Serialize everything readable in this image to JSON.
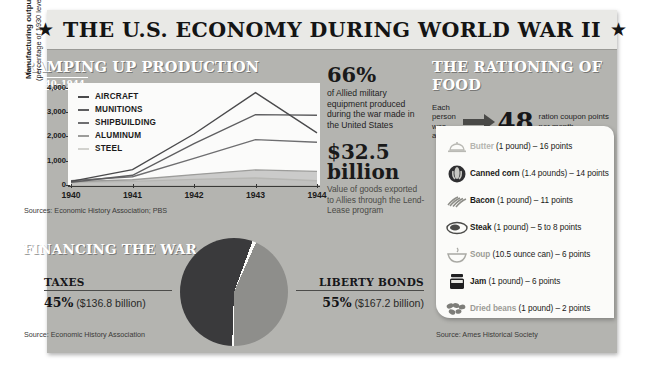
{
  "poster": {
    "title": "THE U.S. ECONOMY DURING WORLD WAR II",
    "star_left": "★",
    "star_right": "★"
  },
  "production": {
    "heading": "RAMPING UP PRODUCTION",
    "date_range": "1940–1944",
    "y_axis_title": "Manufacturing output",
    "y_axis_subtitle": "(percentage of 1930 level)",
    "source": "Sources: Economic History Association; PBS"
  },
  "stats": {
    "percent": "66%",
    "percent_desc": "of Allied military equipment produced during the war made in the United States",
    "dollars": "$32.5 billion",
    "dollars_desc": "Value of goods exported to Allies through the Lend-Lease program"
  },
  "rationing": {
    "heading": "THE RATIONING OF FOOD",
    "allowance_lead": "Each person was allowed",
    "allowance_number": "48",
    "allowance_trail": "ration coupon points per month",
    "source": "Source: Ames Historical Society",
    "items": [
      {
        "icon": "butter-dish-icon",
        "name": "Butter",
        "detail": "(1 pound) – 16 points"
      },
      {
        "icon": "canned-corn-icon",
        "name": "Canned corn",
        "detail": "(1.4 pounds) – 14 points"
      },
      {
        "icon": "bacon-icon",
        "name": "Bacon",
        "detail": "(1 pound) – 11 points"
      },
      {
        "icon": "steak-icon",
        "name": "Steak",
        "detail": "(1 pound) – 5 to 8 points"
      },
      {
        "icon": "soup-bowl-icon",
        "name": "Soup",
        "detail": "(10.5 ounce can) – 6 points"
      },
      {
        "icon": "jam-jar-icon",
        "name": "Jam",
        "detail": "(1 pound) – 6 points"
      },
      {
        "icon": "dried-beans-icon",
        "name": "Dried beans",
        "detail": "(1 pound) – 2 points"
      }
    ]
  },
  "financing": {
    "heading": "FINANCING THE WAR",
    "source": "Source: Economic History Association",
    "taxes_label": "TAXES",
    "taxes_pct": "45%",
    "taxes_amount": "($136.8 billion)",
    "bonds_label": "LIBERTY BONDS",
    "bonds_pct": "55%",
    "bonds_amount": "($167.2 billion)"
  },
  "colors": {
    "poster_bg": "#b4b4b0",
    "title_bg": "#e9e9e6",
    "ink": "#1a1a1a",
    "card_bg": "#fbfbf9",
    "pie_dark": "#3a3a3c",
    "pie_light": "#8e8e8b"
  },
  "chart_data": [
    {
      "type": "line",
      "title": "RAMPING UP PRODUCTION",
      "subtitle": "1940–1944",
      "xlabel": "",
      "ylabel": "Manufacturing output (percentage of 1930 level)",
      "x": [
        "1940",
        "1941",
        "1942",
        "1943",
        "1944"
      ],
      "ylim": [
        0,
        4200
      ],
      "yticks": [
        "0",
        "1,000",
        "2,000",
        "3,000",
        "4,000"
      ],
      "ytick_values": [
        0,
        1000,
        2000,
        3000,
        4000
      ],
      "grid": false,
      "legend_position": "upper-left",
      "series": [
        {
          "name": "AIRCRAFT",
          "values": [
            150,
            630,
            2100,
            3800,
            2150
          ],
          "color": "#4a4a4c"
        },
        {
          "name": "MUNITIONS",
          "values": [
            110,
            400,
            1700,
            2900,
            2870
          ],
          "color": "#5e5e60"
        },
        {
          "name": "SHIPBUILDING",
          "values": [
            180,
            340,
            1100,
            1870,
            1760
          ],
          "color": "#6e6e70"
        },
        {
          "name": "ALUMINUM",
          "values": [
            130,
            220,
            430,
            620,
            560
          ],
          "color": "#9c9c9a"
        },
        {
          "name": "STEEL",
          "values": [
            100,
            150,
            230,
            290,
            175
          ],
          "color": "#d2d2ce"
        }
      ]
    },
    {
      "type": "pie",
      "title": "FINANCING THE WAR",
      "labels": [
        "Liberty Bonds",
        "Taxes"
      ],
      "values": [
        55,
        45
      ],
      "value_amounts": [
        "$167.2 billion",
        "$136.8 billion"
      ],
      "colors": [
        "#3a3a3c",
        "#8e8e8b"
      ],
      "legend_position": "sides"
    }
  ]
}
